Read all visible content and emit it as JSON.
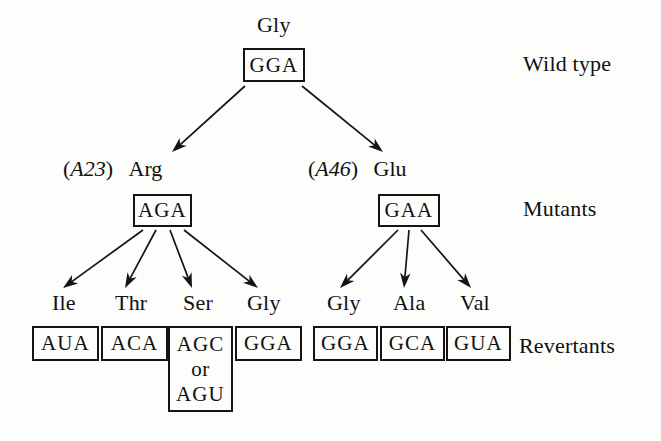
{
  "figure": {
    "type": "genetics-pedigree-diagram",
    "background_color": "#fdfdfc",
    "line_color": "#141414"
  },
  "stage_labels": [
    {
      "id": "wild-type",
      "text": "Wild type",
      "x": 523,
      "y": 52
    },
    {
      "id": "mutants",
      "text": "Mutants",
      "x": 523,
      "y": 197
    },
    {
      "id": "revertants",
      "text": "Revertants",
      "x": 519,
      "y": 334
    }
  ],
  "wild_type": {
    "amino_acid": "Gly",
    "amino_acid_x": 257,
    "amino_acid_y": 14,
    "codon": "GGA",
    "box": {
      "x": 243,
      "y": 48,
      "w": 62,
      "h": 34
    }
  },
  "mutants": [
    {
      "id": "a23-arg",
      "allele": "A23",
      "allele_prefix": "(",
      "allele_suffix": ")",
      "amino_acid": "Arg",
      "label_x": 63,
      "label_y": 158,
      "codon": "AGA",
      "box": {
        "x": 133,
        "y": 194,
        "w": 59,
        "h": 33
      }
    },
    {
      "id": "a46-glu",
      "allele": "A46",
      "allele_prefix": "(",
      "allele_suffix": ")",
      "amino_acid": "Glu",
      "label_x": 308,
      "label_y": 158,
      "codon": "GAA",
      "box": {
        "x": 378,
        "y": 194,
        "w": 62,
        "h": 33
      }
    }
  ],
  "revertants": [
    {
      "id": "ile",
      "parent": "a23-arg",
      "amino_acid": "Ile",
      "label_x": 52,
      "label_y": 292,
      "codon_lines": [
        "AUA"
      ],
      "box": {
        "x": 32,
        "y": 326,
        "w": 67,
        "h": 35
      }
    },
    {
      "id": "thr",
      "parent": "a23-arg",
      "amino_acid": "Thr",
      "label_x": 115,
      "label_y": 292,
      "codon_lines": [
        "ACA"
      ],
      "box": {
        "x": 101,
        "y": 326,
        "w": 67,
        "h": 35
      }
    },
    {
      "id": "ser",
      "parent": "a23-arg",
      "amino_acid": "Ser",
      "label_x": 183,
      "label_y": 292,
      "codon_lines": [
        "AGC",
        "or",
        "AGU"
      ],
      "box": {
        "x": 168,
        "y": 326,
        "w": 65,
        "h": 86
      }
    },
    {
      "id": "gly-left",
      "parent": "a23-arg",
      "amino_acid": "Gly",
      "label_x": 247,
      "label_y": 292,
      "codon_lines": [
        "GGA"
      ],
      "box": {
        "x": 235,
        "y": 326,
        "w": 67,
        "h": 35
      }
    },
    {
      "id": "gly-right",
      "parent": "a46-glu",
      "amino_acid": "Gly",
      "label_x": 327,
      "label_y": 292,
      "codon_lines": [
        "GGA"
      ],
      "box": {
        "x": 313,
        "y": 326,
        "w": 65,
        "h": 35
      }
    },
    {
      "id": "ala",
      "parent": "a46-glu",
      "amino_acid": "Ala",
      "label_x": 393,
      "label_y": 292,
      "codon_lines": [
        "GCA"
      ],
      "box": {
        "x": 380,
        "y": 326,
        "w": 65,
        "h": 35
      }
    },
    {
      "id": "val",
      "parent": "a46-glu",
      "amino_acid": "Val",
      "label_x": 460,
      "label_y": 292,
      "codon_lines": [
        "GUA"
      ],
      "box": {
        "x": 446,
        "y": 326,
        "w": 65,
        "h": 35
      }
    }
  ],
  "arrows": [
    {
      "id": "wt-to-a23",
      "x1": 245,
      "y1": 86,
      "x2": 172,
      "y2": 152
    },
    {
      "id": "wt-to-a46",
      "x1": 302,
      "y1": 86,
      "x2": 383,
      "y2": 152
    },
    {
      "id": "a23-to-ile",
      "x1": 143,
      "y1": 230,
      "x2": 63,
      "y2": 288
    },
    {
      "id": "a23-to-thr",
      "x1": 156,
      "y1": 230,
      "x2": 125,
      "y2": 288
    },
    {
      "id": "a23-to-ser",
      "x1": 170,
      "y1": 230,
      "x2": 192,
      "y2": 288
    },
    {
      "id": "a23-to-gly",
      "x1": 184,
      "y1": 230,
      "x2": 258,
      "y2": 288
    },
    {
      "id": "a46-to-gly",
      "x1": 398,
      "y1": 230,
      "x2": 340,
      "y2": 288
    },
    {
      "id": "a46-to-ala",
      "x1": 409,
      "y1": 230,
      "x2": 404,
      "y2": 288
    },
    {
      "id": "a46-to-val",
      "x1": 421,
      "y1": 230,
      "x2": 471,
      "y2": 288
    }
  ]
}
